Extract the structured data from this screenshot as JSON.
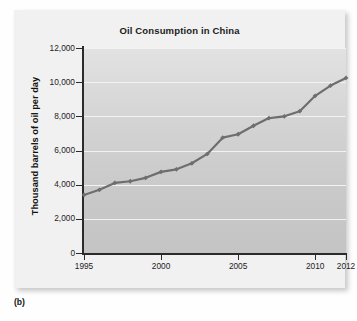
{
  "figure": {
    "panel_label": "(b)"
  },
  "chart_data": {
    "type": "line",
    "title": "Oil Consumption in China",
    "xlabel": "",
    "ylabel": "Thousand barrels of oil per day",
    "x": [
      1995,
      1996,
      1997,
      1998,
      1999,
      2000,
      2001,
      2002,
      2003,
      2004,
      2005,
      2006,
      2007,
      2008,
      2009,
      2010,
      2011,
      2012
    ],
    "values": [
      3400,
      3700,
      4100,
      4200,
      4400,
      4750,
      4900,
      5250,
      5800,
      6750,
      6950,
      7450,
      7900,
      8000,
      8300,
      9200,
      9800,
      10250
    ],
    "series": [
      {
        "name": "Oil consumption",
        "values": [
          3400,
          3700,
          4100,
          4200,
          4400,
          4750,
          4900,
          5250,
          5800,
          6750,
          6950,
          7450,
          7900,
          8000,
          8300,
          9200,
          9800,
          10250
        ]
      }
    ],
    "xlim": [
      1995,
      2012
    ],
    "ylim": [
      0,
      12000
    ],
    "xticks": [
      1995,
      2000,
      2005,
      2010,
      2012
    ],
    "xtick_labels": [
      "1995",
      "2000",
      "2005",
      "2010",
      "2012"
    ],
    "yticks": [
      0,
      2000,
      4000,
      6000,
      8000,
      10000,
      12000
    ],
    "ytick_labels": [
      "0",
      "2,000",
      "4,000",
      "6,000",
      "8,000",
      "10,000",
      "12,000"
    ],
    "grid": true,
    "grid_axis": "y",
    "legend": false,
    "legend_position": "none",
    "line_color": "#6e6e6e",
    "marker": "diamond",
    "plot_background": "#d3d3d3",
    "card_background": "#f1f1f1"
  }
}
